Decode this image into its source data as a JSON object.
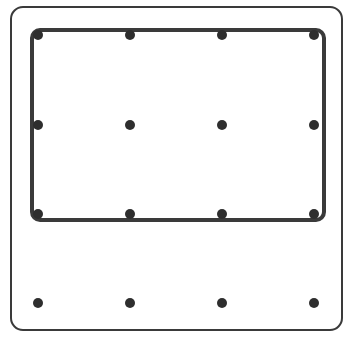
{
  "diagram": {
    "colors": {
      "background": "#ffffff",
      "stroke": "#3a3a3a",
      "dot": "#2e2e2e"
    },
    "outer_frame": {
      "x": 11,
      "y": 7,
      "width": 331,
      "height": 323,
      "radius": 12,
      "stroke_width": 2
    },
    "inner_frame": {
      "x": 32,
      "y": 30,
      "width": 292,
      "height": 190,
      "radius": 8,
      "stroke_width": 4
    },
    "dot_radius": 5,
    "grid": {
      "columns_x": [
        38,
        130,
        222,
        314
      ],
      "rows_y": [
        35,
        125,
        214,
        303
      ]
    }
  }
}
